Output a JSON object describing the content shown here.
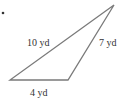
{
  "diagram": {
    "type": "triangle",
    "bullet": "•",
    "sides": [
      {
        "id": "left",
        "label": "10 yd",
        "length": 10,
        "unit": "yd"
      },
      {
        "id": "right",
        "label": "7 yd",
        "length": 7,
        "unit": "yd"
      },
      {
        "id": "bottom",
        "label": "4 yd",
        "length": 4,
        "unit": "yd"
      }
    ],
    "colors": {
      "stroke": "#7a7a7a",
      "text": "#333333"
    }
  }
}
